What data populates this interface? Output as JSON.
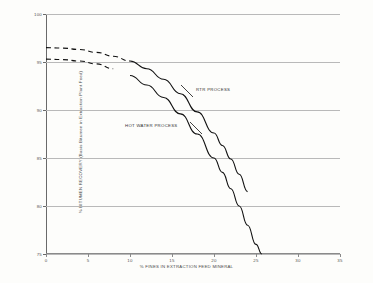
{
  "chart_data": {
    "type": "line",
    "title": "",
    "xlabel": "% FINES IN EXTRACTION FEED MINERAL",
    "ylabel": "% BITUMEN RECOVERY (Basis Bitumen in Extraction Plant Feed)",
    "xlim": [
      0,
      35
    ],
    "ylim": [
      75,
      100
    ],
    "xticks": [
      0,
      5,
      10,
      15,
      20,
      25,
      30,
      35
    ],
    "yticks": [
      75,
      80,
      85,
      90,
      95,
      100
    ],
    "grid": true,
    "legend_position": "inline-annotations",
    "series": [
      {
        "name": "RTR PROCESS",
        "style": "dashed-then-solid",
        "dash_until_x": 10,
        "points": [
          {
            "x": 0,
            "y": 96.5
          },
          {
            "x": 2,
            "y": 96.45
          },
          {
            "x": 4,
            "y": 96.3
          },
          {
            "x": 6,
            "y": 96.0
          },
          {
            "x": 8,
            "y": 95.6
          },
          {
            "x": 10,
            "y": 95.1
          },
          {
            "x": 12,
            "y": 94.3
          },
          {
            "x": 14,
            "y": 93.2
          },
          {
            "x": 16,
            "y": 91.7
          },
          {
            "x": 18,
            "y": 89.8
          },
          {
            "x": 20,
            "y": 87.6
          },
          {
            "x": 21,
            "y": 86.3
          },
          {
            "x": 22,
            "y": 84.9
          },
          {
            "x": 23,
            "y": 83.3
          },
          {
            "x": 24,
            "y": 81.5
          }
        ]
      },
      {
        "name": "HOT WATER PROCESS",
        "style": "dashed-then-solid",
        "dash_until_x": 9.5,
        "points": [
          {
            "x": 0,
            "y": 95.3
          },
          {
            "x": 2,
            "y": 95.25
          },
          {
            "x": 4,
            "y": 95.1
          },
          {
            "x": 6,
            "y": 94.8
          },
          {
            "x": 8,
            "y": 94.3
          },
          {
            "x": 10,
            "y": 93.6
          },
          {
            "x": 12,
            "y": 92.6
          },
          {
            "x": 14,
            "y": 91.3
          },
          {
            "x": 16,
            "y": 89.6
          },
          {
            "x": 18,
            "y": 87.5
          },
          {
            "x": 20,
            "y": 85.0
          },
          {
            "x": 21,
            "y": 83.5
          },
          {
            "x": 22,
            "y": 81.8
          },
          {
            "x": 23,
            "y": 80.0
          },
          {
            "x": 24,
            "y": 78.0
          },
          {
            "x": 25,
            "y": 76.0
          },
          {
            "x": 25.7,
            "y": 75.0
          }
        ]
      }
    ],
    "annotations": [
      {
        "text": "RTR PROCESS",
        "series": "RTR PROCESS"
      },
      {
        "text": "HOT WATER PROCESS",
        "series": "HOT WATER PROCESS"
      }
    ],
    "colors": {
      "curve": "#111111",
      "grid": "#b9b9b9",
      "axis": "#6a6a6a",
      "background": "#fdfdfb",
      "text": "#4a4a4a"
    }
  }
}
